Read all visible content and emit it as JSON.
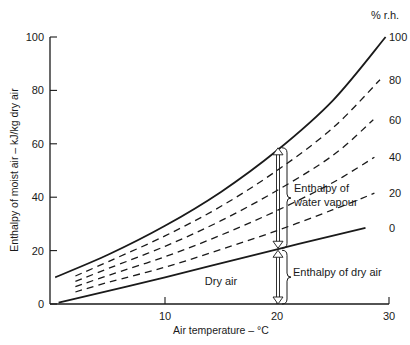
{
  "chart_data": {
    "type": "line",
    "title": "",
    "xlabel": "Air temperature – °C",
    "ylabel": "Enthalpy of moist air – kJ/kg dry air",
    "xlim": [
      0,
      30
    ],
    "ylim": [
      0,
      100
    ],
    "x_ticks": [
      10,
      20,
      30
    ],
    "y_ticks": [
      0,
      20,
      40,
      60,
      80,
      100
    ],
    "grid": false,
    "legend_title": "% r.h.",
    "series": [
      {
        "name": "100",
        "style": "solid",
        "x": [
          0.2,
          5,
          10,
          15,
          20,
          25,
          29.7
        ],
        "values": [
          10,
          18.6,
          29.3,
          42.0,
          57.5,
          76.3,
          100
        ]
      },
      {
        "name": "80",
        "style": "dashed",
        "x": [
          2,
          5,
          10,
          15,
          20,
          25,
          29.2
        ],
        "values": [
          10.5,
          16.0,
          25.5,
          36.6,
          50.0,
          66.0,
          84.0
        ]
      },
      {
        "name": "60",
        "style": "dashed",
        "x": [
          2,
          5,
          10,
          15,
          20,
          25,
          28.6
        ],
        "values": [
          8.5,
          13.4,
          21.6,
          31.2,
          42.5,
          55.7,
          69.0
        ]
      },
      {
        "name": "40",
        "style": "dashed",
        "x": [
          2,
          5,
          10,
          15,
          20,
          25,
          28.7
        ],
        "values": [
          6.5,
          10.8,
          17.7,
          25.8,
          35.0,
          45.5,
          55.0
        ]
      },
      {
        "name": "20",
        "style": "dashed",
        "x": [
          2,
          5,
          10,
          15,
          20,
          25,
          28.7
        ],
        "values": [
          4.5,
          8.2,
          13.8,
          20.4,
          27.5,
          35.3,
          41.5
        ]
      },
      {
        "name": "0",
        "style": "solid",
        "x": [
          0.5,
          10,
          20,
          27.9
        ],
        "values": [
          0.5,
          10,
          20.5,
          28.5
        ]
      }
    ],
    "annotations": [
      {
        "text": "Dry air",
        "x": 15,
        "y": 8.5
      },
      {
        "text": "Enthalpy of water vapour",
        "x": 21.5,
        "y": 41,
        "bracket": [
          20.5,
          58.5
        ]
      },
      {
        "text": "Enthalpy of dry air",
        "x": 21.5,
        "y": 10,
        "bracket": [
          0,
          20.5
        ]
      }
    ],
    "arrows": [
      {
        "x": 20,
        "from": 58.5,
        "to": 20.5,
        "direction": "double"
      },
      {
        "x": 20,
        "from": 20.5,
        "to": 0,
        "direction": "double"
      }
    ]
  },
  "labels": {
    "legend_title": "% r.h.",
    "xlabel": "Air temperature – °C",
    "ylabel": "Enthalpy of moist air – kJ/kg dry air",
    "dry_air": "Dry air",
    "water_vapour_1": "Enthalpy of",
    "water_vapour_2": "water vapour",
    "dry_air_enthalpy": "Enthalpy of dry air"
  }
}
